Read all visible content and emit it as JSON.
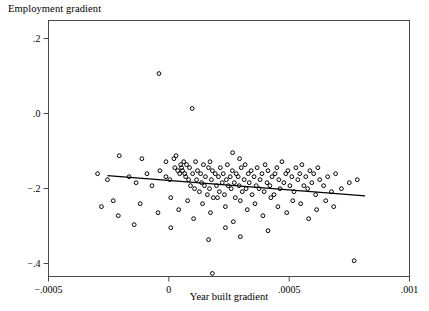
{
  "chart_data": {
    "type": "scatter",
    "title": "Employment gradient",
    "xlabel": "Year built gradient",
    "ylabel": "",
    "xlim": [
      -0.0005,
      0.001
    ],
    "ylim": [
      -0.45,
      0.22
    ],
    "xticks": [
      -0.0005,
      0,
      0.0005,
      0.001
    ],
    "xticklabels": [
      "−.0005",
      "0",
      ".0005",
      ".001"
    ],
    "yticks": [
      0.2,
      0.0,
      -0.2,
      -0.4
    ],
    "yticklabels": [
      ".2",
      ".0",
      "−.2",
      "−.4"
    ],
    "grid": false,
    "legend": null,
    "marker": "open-circle",
    "marker_color": "#000000",
    "fit_line": {
      "label": "linear fit",
      "color": "#000000",
      "x_start": -0.000255,
      "y_start": -0.1655,
      "x_end": 0.000815,
      "y_end": -0.2195
    },
    "points": [
      [
        -4.1e-05,
        0.1065
      ],
      [
        9.7e-05,
        0.0135
      ],
      [
        -0.000206,
        -0.1125
      ],
      [
        -0.000112,
        -0.1205
      ],
      [
        -1.2e-05,
        -0.1285
      ],
      [
        2.1e-05,
        -0.1205
      ],
      [
        3e-05,
        -0.1125
      ],
      [
        0.000171,
        -0.1285
      ],
      [
        0.000265,
        -0.1045
      ],
      [
        0.000294,
        -0.1205
      ],
      [
        -0.000296,
        -0.1605
      ],
      [
        -0.000255,
        -0.1765
      ],
      [
        -0.000165,
        -0.1685
      ],
      [
        -0.000136,
        -0.1845
      ],
      [
        -9.1e-05,
        -0.1605
      ],
      [
        -7e-05,
        -0.1925
      ],
      [
        -3.7e-05,
        -0.1525
      ],
      [
        -1.2e-05,
        -0.1685
      ],
      [
        4e-06,
        -0.1765
      ],
      [
        2.5e-05,
        -0.1445
      ],
      [
        3.7e-05,
        -0.1525
      ],
      [
        4.5e-05,
        -0.1605
      ],
      [
        4.9e-05,
        -0.1365
      ],
      [
        5.3e-05,
        -0.1445
      ],
      [
        5.7e-05,
        -0.1525
      ],
      [
        6.2e-05,
        -0.1285
      ],
      [
        6.6e-05,
        -0.1605
      ],
      [
        7e-05,
        -0.1685
      ],
      [
        7.4e-05,
        -0.1365
      ],
      [
        8.2e-05,
        -0.1765
      ],
      [
        8.6e-05,
        -0.1445
      ],
      [
        9e-05,
        -0.1925
      ],
      [
        9.9e-05,
        -0.1605
      ],
      [
        0.000107,
        -0.2005
      ],
      [
        0.000111,
        -0.1285
      ],
      [
        0.000115,
        -0.1765
      ],
      [
        0.000119,
        -0.1525
      ],
      [
        0.000127,
        -0.2085
      ],
      [
        0.000132,
        -0.1605
      ],
      [
        0.000136,
        -0.1845
      ],
      [
        0.000144,
        -0.1365
      ],
      [
        0.000148,
        -0.1925
      ],
      [
        0.000152,
        -0.1685
      ],
      [
        0.00016,
        -0.2165
      ],
      [
        0.000165,
        -0.1445
      ],
      [
        0.000169,
        -0.2005
      ],
      [
        0.000177,
        -0.1765
      ],
      [
        0.000181,
        -0.1525
      ],
      [
        0.000185,
        -0.2245
      ],
      [
        0.000193,
        -0.1605
      ],
      [
        0.000198,
        -0.1925
      ],
      [
        0.000206,
        -0.1685
      ],
      [
        0.00021,
        -0.2085
      ],
      [
        0.000214,
        -0.1445
      ],
      [
        0.000222,
        -0.1845
      ],
      [
        0.000226,
        -0.1605
      ],
      [
        0.000231,
        -0.2165
      ],
      [
        0.000239,
        -0.1765
      ],
      [
        0.000243,
        -0.1365
      ],
      [
        0.000247,
        -0.1925
      ],
      [
        0.000255,
        -0.1685
      ],
      [
        0.000259,
        -0.2005
      ],
      [
        0.000264,
        -0.1525
      ],
      [
        0.000272,
        -0.1845
      ],
      [
        0.000276,
        -0.2245
      ],
      [
        0.00028,
        -0.1605
      ],
      [
        0.000288,
        -0.1685
      ],
      [
        0.000292,
        -0.1925
      ],
      [
        0.000301,
        -0.1445
      ],
      [
        0.000305,
        -0.2085
      ],
      [
        0.000313,
        -0.1765
      ],
      [
        0.000317,
        -0.1365
      ],
      [
        0.000321,
        -0.2005
      ],
      [
        0.00033,
        -0.1605
      ],
      [
        0.000334,
        -0.1845
      ],
      [
        0.000342,
        -0.1525
      ],
      [
        0.000346,
        -0.2165
      ],
      [
        0.000354,
        -0.1685
      ],
      [
        0.000363,
        -0.1925
      ],
      [
        0.000367,
        -0.1445
      ],
      [
        0.000375,
        -0.2005
      ],
      [
        0.000379,
        -0.1765
      ],
      [
        0.000387,
        -0.1605
      ],
      [
        0.000396,
        -0.2085
      ],
      [
        0.0004,
        -0.1365
      ],
      [
        0.000408,
        -0.1845
      ],
      [
        0.000412,
        -0.1525
      ],
      [
        0.00042,
        -0.1925
      ],
      [
        0.000429,
        -0.1685
      ],
      [
        0.000437,
        -0.2165
      ],
      [
        0.000441,
        -0.1605
      ],
      [
        0.000449,
        -0.1445
      ],
      [
        0.000457,
        -0.1765
      ],
      [
        0.000462,
        -0.2005
      ],
      [
        0.00047,
        -0.1285
      ],
      [
        0.000478,
        -0.1845
      ],
      [
        0.000486,
        -0.1605
      ],
      [
        0.000495,
        -0.1525
      ],
      [
        0.000503,
        -0.1925
      ],
      [
        0.000511,
        -0.1685
      ],
      [
        0.00052,
        -0.2085
      ],
      [
        0.000528,
        -0.1445
      ],
      [
        0.000536,
        -0.1765
      ],
      [
        0.000544,
        -0.1605
      ],
      [
        0.000553,
        -0.1365
      ],
      [
        0.000561,
        -0.1925
      ],
      [
        0.000569,
        -0.1685
      ],
      [
        0.000577,
        -0.2005
      ],
      [
        0.000586,
        -0.1525
      ],
      [
        0.000594,
        -0.1845
      ],
      [
        0.000602,
        -0.1605
      ],
      [
        0.00061,
        -0.2165
      ],
      [
        0.000619,
        -0.1445
      ],
      [
        0.000627,
        -0.1765
      ],
      [
        0.000643,
        -0.1925
      ],
      [
        0.00066,
        -0.1685
      ],
      [
        0.000676,
        -0.2085
      ],
      [
        0.000693,
        -0.1605
      ],
      [
        0.000717,
        -0.2005
      ],
      [
        0.00075,
        -0.1845
      ],
      [
        0.000783,
        -0.1765
      ],
      [
        -0.00028,
        -0.2485
      ],
      [
        -0.000231,
        -0.2325
      ],
      [
        -0.00021,
        -0.2725
      ],
      [
        -0.000119,
        -0.2405
      ],
      [
        -4.5e-05,
        -0.2645
      ],
      [
        8e-06,
        -0.2245
      ],
      [
        4.1e-05,
        -0.2565
      ],
      [
        7.8e-05,
        -0.2325
      ],
      [
        0.000103,
        -0.2805
      ],
      [
        0.00014,
        -0.2405
      ],
      [
        0.000173,
        -0.2645
      ],
      [
        0.000202,
        -0.2245
      ],
      [
        0.000235,
        -0.2485
      ],
      [
        0.000268,
        -0.2885
      ],
      [
        0.000297,
        -0.2325
      ],
      [
        0.000326,
        -0.2565
      ],
      [
        0.000358,
        -0.2405
      ],
      [
        0.000391,
        -0.2725
      ],
      [
        0.000424,
        -0.2245
      ],
      [
        0.000453,
        -0.2485
      ],
      [
        0.00049,
        -0.2645
      ],
      [
        0.000515,
        -0.2325
      ],
      [
        0.000548,
        -0.2405
      ],
      [
        0.000581,
        -0.2805
      ],
      [
        0.000614,
        -0.2565
      ],
      [
        0.000652,
        -0.2325
      ],
      [
        0.000685,
        -0.2485
      ],
      [
        0.000165,
        -0.3365
      ],
      [
        0.000235,
        -0.3045
      ],
      [
        0.000297,
        -0.3285
      ],
      [
        0.000412,
        -0.3125
      ],
      [
        0.000181,
        -0.4265
      ],
      [
        0.00077,
        -0.3925
      ],
      [
        -0.000144,
        -0.2965
      ],
      [
        8e-06,
        -0.3045
      ]
    ]
  }
}
